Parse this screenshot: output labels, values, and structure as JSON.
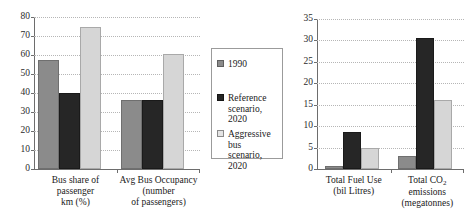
{
  "legend": {
    "entries": [
      {
        "label": "1990",
        "color": "#8b8b8b"
      },
      {
        "label": "Reference\nscenario, 2020",
        "color": "#262626"
      },
      {
        "label": "Aggressive bus\nscenario, 2020",
        "color": "#d6d6d6"
      }
    ]
  },
  "chart_data": [
    {
      "type": "bar",
      "title": "",
      "xlabel": "",
      "ylabel": "",
      "ylim": [
        0,
        80
      ],
      "yticks": [
        0,
        10,
        20,
        30,
        40,
        50,
        60,
        70,
        80
      ],
      "grid": true,
      "legend_position": "right",
      "categories": [
        "Bus share of\npassenger\nkm (%)",
        "Avg Bus Occupancy\n(number\nof passengers)"
      ],
      "series": [
        {
          "name": "1990",
          "values": [
            57.5,
            36.5
          ]
        },
        {
          "name": "Reference scenario, 2020",
          "values": [
            40.0,
            36.5
          ]
        },
        {
          "name": "Aggressive bus scenario, 2020",
          "values": [
            75.0,
            60.5
          ]
        }
      ]
    },
    {
      "type": "bar",
      "title": "",
      "xlabel": "",
      "ylabel": "",
      "ylim": [
        0,
        35
      ],
      "yticks": [
        0,
        5,
        10,
        15,
        20,
        25,
        30,
        35
      ],
      "grid": true,
      "legend_position": "none",
      "categories": [
        "Total Fuel Use\n(bil Litres)",
        "Total CO2\nemissions\n(megatonnes)"
      ],
      "categories_display": [
        {
          "line1": "Total Fuel Use",
          "line2": "(bil Litres)",
          "line3": ""
        },
        {
          "line1": "Total CO",
          "sub": "2",
          "line1_tail": " emissions",
          "line2": "emissions",
          "line3": "(megatonnes)"
        }
      ],
      "series": [
        {
          "name": "1990",
          "values": [
            0.8,
            3.0
          ]
        },
        {
          "name": "Reference scenario, 2020",
          "values": [
            8.7,
            30.5
          ]
        },
        {
          "name": "Aggressive bus scenario, 2020",
          "values": [
            4.9,
            16.0
          ]
        }
      ]
    }
  ]
}
